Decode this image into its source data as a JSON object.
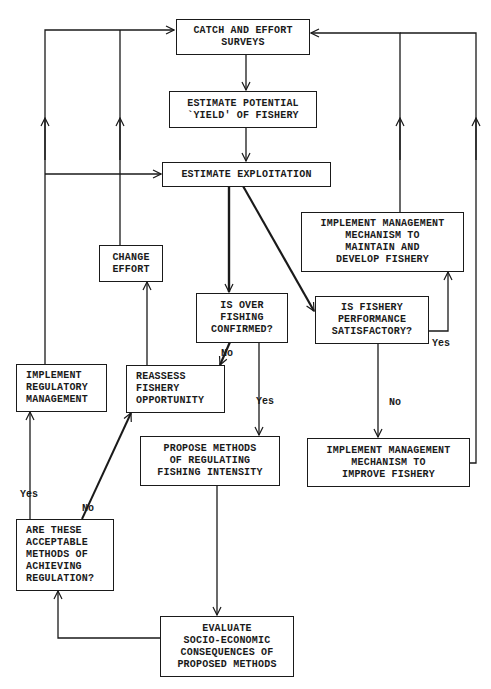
{
  "diagram": {
    "type": "flowchart",
    "nodes": {
      "catch_effort": {
        "label": "CATCH AND EFFORT\nSURVEYS"
      },
      "estimate_yield": {
        "label": "ESTIMATE POTENTIAL\n`YIELD' OF FISHERY"
      },
      "estimate_exploitation": {
        "label": "ESTIMATE EXPLOITATION"
      },
      "change_effort": {
        "label": "CHANGE\nEFFORT"
      },
      "maintain_develop": {
        "label": "IMPLEMENT MANAGEMENT\nMECHANISM TO\nMAINTAIN AND\nDEVELOP FISHERY"
      },
      "over_fishing": {
        "label": "IS OVER\nFISHING\nCONFIRMED?"
      },
      "performance": {
        "label": "IS FISHERY\nPERFORMANCE\nSATISFACTORY?"
      },
      "regulatory": {
        "label": "IMPLEMENT\nREGULATORY\nMANAGEMENT"
      },
      "reassess": {
        "label": "REASSESS\nFISHERY\nOPPORTUNITY"
      },
      "propose": {
        "label": "PROPOSE METHODS\nOF REGULATING\nFISHING INTENSITY"
      },
      "improve": {
        "label": "IMPLEMENT MANAGEMENT\nMECHANISM TO\nIMPROVE FISHERY"
      },
      "acceptable": {
        "label": "ARE THESE\nACCEPTABLE\nMETHODS OF\nACHIEVING\nREGULATION?"
      },
      "evaluate": {
        "label": "EVALUATE\nSOCIO-ECONOMIC\nCONSEQUENCES OF\nPROPOSED METHODS"
      }
    },
    "edge_labels": {
      "over_fishing_no": "No",
      "over_fishing_yes": "Yes",
      "performance_yes": "Yes",
      "performance_no": "No",
      "acceptable_yes": "Yes",
      "acceptable_no": "No"
    },
    "edges": [
      {
        "from": "catch_effort",
        "to": "estimate_yield"
      },
      {
        "from": "estimate_yield",
        "to": "estimate_exploitation"
      },
      {
        "from": "estimate_exploitation",
        "to": "over_fishing"
      },
      {
        "from": "estimate_exploitation",
        "to": "performance"
      },
      {
        "from": "over_fishing",
        "to": "reassess",
        "label": "No"
      },
      {
        "from": "over_fishing",
        "to": "propose",
        "label": "Yes"
      },
      {
        "from": "performance",
        "to": "maintain_develop",
        "label": "Yes"
      },
      {
        "from": "performance",
        "to": "improve",
        "label": "No"
      },
      {
        "from": "maintain_develop",
        "to": "catch_effort"
      },
      {
        "from": "improve",
        "to": "catch_effort"
      },
      {
        "from": "reassess",
        "to": "change_effort"
      },
      {
        "from": "change_effort",
        "to": "catch_effort"
      },
      {
        "from": "regulatory",
        "to": "catch_effort"
      },
      {
        "from": "regulatory",
        "to": "estimate_exploitation"
      },
      {
        "from": "propose",
        "to": "evaluate"
      },
      {
        "from": "evaluate",
        "to": "acceptable"
      },
      {
        "from": "acceptable",
        "to": "regulatory",
        "label": "Yes"
      },
      {
        "from": "acceptable",
        "to": "reassess",
        "label": "No"
      }
    ]
  }
}
